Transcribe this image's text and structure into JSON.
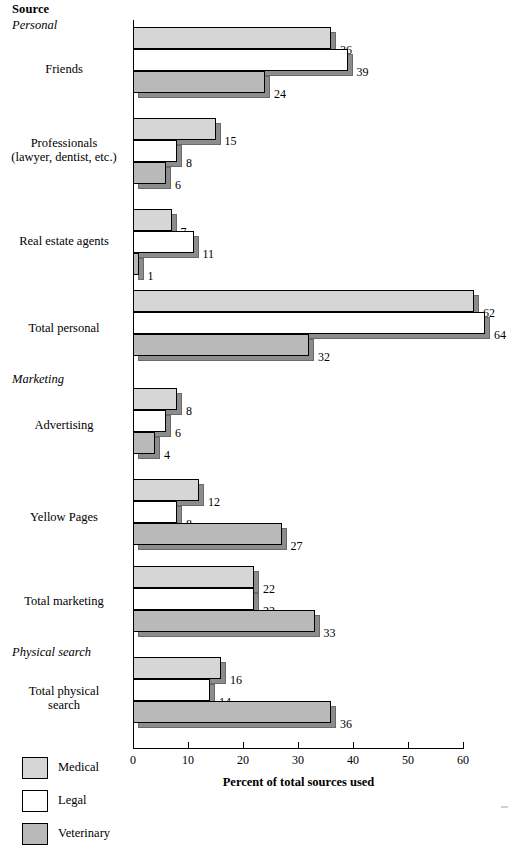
{
  "header": {
    "source_label": "Source"
  },
  "axis": {
    "x_title": "Percent of total sources used",
    "ticks": [
      {
        "value": 0,
        "label": "0"
      },
      {
        "value": 10,
        "label": "10"
      },
      {
        "value": 20,
        "label": "20"
      },
      {
        "value": 30,
        "label": "30"
      },
      {
        "value": 40,
        "label": "40"
      },
      {
        "value": 50,
        "label": "50"
      },
      {
        "value": 60,
        "label": "60"
      }
    ]
  },
  "legend": [
    {
      "name": "Medical",
      "color": "#d6d6d6"
    },
    {
      "name": "Legal",
      "color": "#ffffff"
    },
    {
      "name": "Veterinary",
      "color": "#b9b9b9"
    }
  ],
  "groups": [
    {
      "header": "Personal"
    },
    {
      "header": "Marketing"
    },
    {
      "header": "Physical search"
    }
  ],
  "categories": [
    "Friends",
    "Professionals\n(lawyer, dentist, etc.)",
    "Real estate agents",
    "Total personal",
    "Advertising",
    "Yellow Pages",
    "Total marketing",
    "Total physical\nsearch"
  ],
  "chart_data": {
    "type": "bar",
    "orientation": "horizontal",
    "title": "Source",
    "xlabel": "Percent of total sources used",
    "ylabel": "Source",
    "xlim": [
      0,
      60
    ],
    "grid": false,
    "legend_position": "bottom-left",
    "group_headers": [
      "Personal",
      "Marketing",
      "Physical search"
    ],
    "categories": [
      "Friends",
      "Professionals (lawyer, dentist, etc.)",
      "Real estate agents",
      "Total personal",
      "Advertising",
      "Yellow Pages",
      "Total marketing",
      "Total physical search"
    ],
    "series": [
      {
        "name": "Medical",
        "color": "#d6d6d6",
        "values": [
          36,
          15,
          7,
          62,
          8,
          12,
          22,
          16
        ]
      },
      {
        "name": "Legal",
        "color": "#ffffff",
        "values": [
          39,
          8,
          11,
          64,
          6,
          8,
          22,
          14
        ]
      },
      {
        "name": "Veterinary",
        "color": "#b9b9b9",
        "values": [
          24,
          6,
          1,
          32,
          4,
          27,
          33,
          36
        ]
      }
    ],
    "data_labels": [
      {
        "category": "Friends",
        "Medical": 36,
        "Legal": 39,
        "Veterinary": 24
      },
      {
        "category": "Professionals (lawyer, dentist, etc.)",
        "Medical": 15,
        "Legal": 8,
        "Veterinary": 6
      },
      {
        "category": "Real estate agents",
        "Medical": 7,
        "Legal": 11,
        "Veterinary": 1
      },
      {
        "category": "Total personal",
        "Medical": 62,
        "Legal": 64,
        "Veterinary": 32
      },
      {
        "category": "Advertising",
        "Medical": 8,
        "Legal": 6,
        "Veterinary": 4
      },
      {
        "category": "Yellow Pages",
        "Medical": 12,
        "Legal": 8,
        "Veterinary": 27
      },
      {
        "category": "Total marketing",
        "Medical": 22,
        "Legal": 22,
        "Veterinary": 33
      },
      {
        "category": "Total physical search",
        "Medical": 16,
        "Legal": 14,
        "Veterinary": 36
      }
    ]
  }
}
